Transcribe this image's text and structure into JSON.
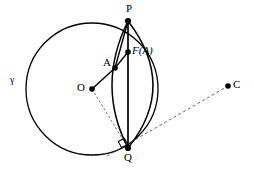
{
  "figure": {
    "type": "geometry-diagram",
    "width": 254,
    "height": 171,
    "background_color": "#ffffff",
    "stroke_color": "#000000"
  },
  "labels": {
    "circle_gamma": "γ",
    "point_p": "P",
    "point_q": "Q",
    "point_o": "O",
    "point_a": "A",
    "point_c": "C",
    "point_fa": "F(A)"
  },
  "points": [
    {
      "name": "P",
      "label": "P",
      "x": 128,
      "y": 21,
      "dot": true,
      "label_x": 126,
      "label_y": 4,
      "italic": false
    },
    {
      "name": "F(A)",
      "label": "F(A)",
      "x": 128,
      "y": 52,
      "dot": true,
      "label_x": 133,
      "label_y": 46,
      "italic": true
    },
    {
      "name": "A",
      "label": "A",
      "x": 115,
      "y": 68,
      "dot": true,
      "label_x": 103,
      "label_y": 58,
      "italic": false
    },
    {
      "name": "O",
      "label": "O",
      "x": 92,
      "y": 89,
      "dot": true,
      "label_x": 78,
      "label_y": 83,
      "italic": false
    },
    {
      "name": "Q",
      "label": "Q",
      "x": 128,
      "y": 148,
      "dot": true,
      "label_x": 125,
      "label_y": 153,
      "italic": false
    },
    {
      "name": "C",
      "label": "C",
      "x": 228,
      "y": 86,
      "dot": true,
      "label_x": 233,
      "label_y": 80,
      "italic": false
    }
  ],
  "circle": {
    "name": "gamma",
    "center_x": 92,
    "center_y": 89,
    "radius": 66,
    "label": "γ",
    "label_x": 10,
    "label_y": 76
  },
  "arcs": [
    {
      "name": "arc-left-p-q",
      "from": "P",
      "to": "Q",
      "bulge": "left",
      "control_x": 96,
      "control_y": 86
    },
    {
      "name": "arc-right-p-q",
      "from": "P",
      "to": "Q",
      "bulge": "right",
      "control_x": 178,
      "control_y": 86
    }
  ],
  "segments": [
    {
      "name": "segment-pq",
      "from": "P",
      "to": "Q",
      "style": "solid",
      "weight": 1.6
    },
    {
      "name": "segment-o-a",
      "from": "O",
      "to": "A",
      "style": "solid",
      "weight": 1.4
    },
    {
      "name": "segment-a-p",
      "from": "A",
      "to": "P",
      "style": "solid",
      "weight": 1.4
    },
    {
      "name": "segment-a-fa",
      "from": "A",
      "to": "F(A)",
      "style": "solid",
      "weight": 1.4
    },
    {
      "name": "segment-o-q",
      "from": "O",
      "to": "Q",
      "style": "dashed",
      "weight": 0.7
    },
    {
      "name": "tangent-line-qc",
      "from": "Q",
      "to": "C",
      "style": "dashed",
      "weight": 0.7
    }
  ],
  "markers": {
    "right_angle_at_q": {
      "name": "right-angle-marker",
      "x": 122,
      "y": 142,
      "size": 6
    }
  }
}
